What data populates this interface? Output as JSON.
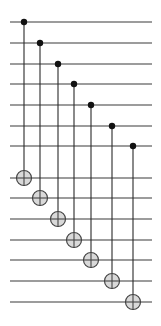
{
  "diagram": {
    "type": "quantum-circuit",
    "wire_count": 14,
    "gates": [
      {
        "name": "CNOT",
        "control_wire": 1,
        "target_wire": 8
      },
      {
        "name": "CNOT",
        "control_wire": 2,
        "target_wire": 9
      },
      {
        "name": "CNOT",
        "control_wire": 3,
        "target_wire": 10
      },
      {
        "name": "CNOT",
        "control_wire": 4,
        "target_wire": 11
      },
      {
        "name": "CNOT",
        "control_wire": 5,
        "target_wire": 12
      },
      {
        "name": "CNOT",
        "control_wire": 6,
        "target_wire": 13
      },
      {
        "name": "CNOT",
        "control_wire": 7,
        "target_wire": 14
      }
    ],
    "colors": {
      "wire": "#3a3a3a",
      "control": "#111111",
      "target_fill": "#d9d9d9",
      "target_stroke": "#444444"
    }
  }
}
